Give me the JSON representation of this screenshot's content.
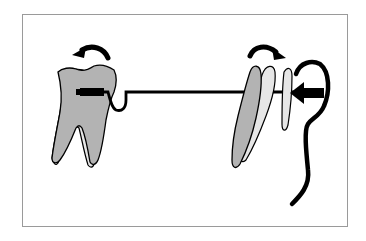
{
  "figure": {
    "type": "orthodontic-illustration",
    "colors": {
      "tooth_fill": "#b3b3b3",
      "tooth_ghost_fill": "#e6e6e6",
      "outline": "#000000",
      "frame": "#9a9a9a",
      "background": "#ffffff"
    },
    "elements": {
      "left_tooth": {
        "label": "molar",
        "rotation_arrow": "counter-clockwise"
      },
      "right_tooth": {
        "label": "incisor",
        "rotation_arrow": "clockwise",
        "stages": 3
      },
      "wire": {
        "label": "archwire"
      },
      "force_arrow": {
        "direction": "left"
      },
      "soft_tissue": {
        "label": "lip-outline"
      }
    }
  }
}
